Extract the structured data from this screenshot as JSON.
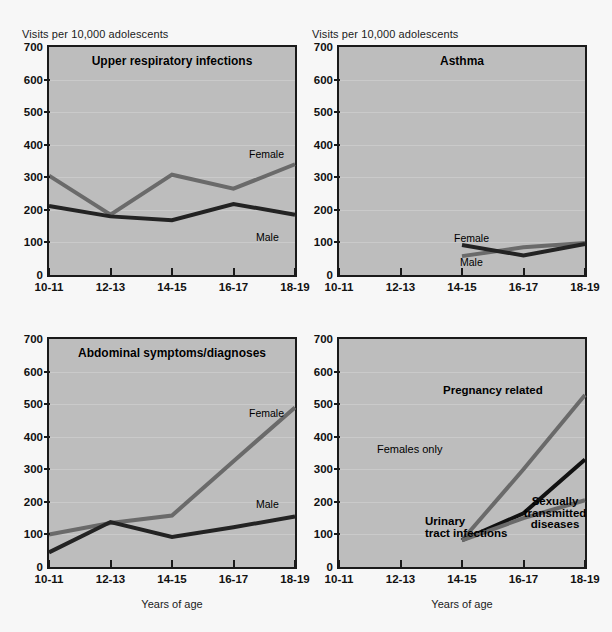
{
  "figure": {
    "y_axis_title": "Visits per 10,000 adolescents",
    "x_axis_caption": "Years of age",
    "colors": {
      "plot_background": "#bdbdbd",
      "page_background": "#f7f7f7",
      "axis": "#1a1a1a",
      "female_line": "#6a6a6a",
      "male_line": "#232323",
      "pregnancy_line": "#6a6a6a",
      "uti_line": "#111111",
      "std_line": "#6a6a6a",
      "gridline": "#cfcfcf"
    }
  },
  "axes": {
    "y_ticks": [
      "700",
      "600",
      "500",
      "400",
      "300",
      "200",
      "100",
      "0"
    ],
    "y_values": [
      700,
      600,
      500,
      400,
      300,
      200,
      100,
      0
    ],
    "x_ticks": [
      "10-11",
      "12-13",
      "14-15",
      "16-17",
      "18-19"
    ],
    "ylim": [
      0,
      700
    ]
  },
  "chart_data": [
    {
      "type": "line",
      "panel": "top-left",
      "title": "Upper respiratory infections",
      "xlabel": "",
      "ylabel": "Visits per 10,000 adolescents",
      "categories": [
        "10-11",
        "12-13",
        "14-15",
        "16-17",
        "18-19"
      ],
      "ylim": [
        0,
        700
      ],
      "grid": true,
      "legend": "inline-labels",
      "series": [
        {
          "name": "Female",
          "color": "#6a6a6a",
          "values": [
            305,
            185,
            308,
            265,
            340
          ],
          "label_position": "end-above"
        },
        {
          "name": "Male",
          "color": "#232323",
          "values": [
            212,
            180,
            168,
            218,
            185
          ],
          "label_position": "end-below"
        }
      ]
    },
    {
      "type": "line",
      "panel": "top-right",
      "title": "Asthma",
      "xlabel": "",
      "ylabel": "Visits per 10,000 adolescents",
      "categories": [
        "10-11",
        "12-13",
        "14-15",
        "16-17",
        "18-19"
      ],
      "ylim": [
        0,
        700
      ],
      "grid": true,
      "legend": "inline-labels",
      "series": [
        {
          "name": "Female",
          "color": "#6a6a6a",
          "values": [
            null,
            null,
            58,
            85,
            98
          ],
          "label_position": "mid-above"
        },
        {
          "name": "Male",
          "color": "#232323",
          "values": [
            null,
            null,
            92,
            60,
            95
          ],
          "label_position": "mid-below"
        }
      ]
    },
    {
      "type": "line",
      "panel": "bottom-left",
      "title": "Abdominal symptoms/diagnoses",
      "xlabel": "Years of age",
      "ylabel": "Visits per 10,000 adolescents",
      "categories": [
        "10-11",
        "12-13",
        "14-15",
        "16-17",
        "18-19"
      ],
      "ylim": [
        0,
        700
      ],
      "grid": true,
      "legend": "inline-labels",
      "series": [
        {
          "name": "Female",
          "color": "#6a6a6a",
          "values": [
            100,
            135,
            158,
            325,
            490
          ],
          "label_position": "end-above"
        },
        {
          "name": "Male",
          "color": "#232323",
          "values": [
            45,
            138,
            92,
            122,
            155
          ],
          "label_position": "end-above"
        }
      ]
    },
    {
      "type": "line",
      "panel": "bottom-right",
      "title": "",
      "annotation": "Females only",
      "xlabel": "Years of age",
      "ylabel": "Visits per 10,000 adolescents",
      "categories": [
        "10-11",
        "12-13",
        "14-15",
        "16-17",
        "18-19"
      ],
      "ylim": [
        0,
        700
      ],
      "grid": true,
      "legend": "inline-labels",
      "series": [
        {
          "name": "Pregnancy related",
          "color": "#6a6a6a",
          "values": [
            null,
            null,
            82,
            300,
            528
          ],
          "label_position": "above-right"
        },
        {
          "name": "Urinary tract infections",
          "color": "#111111",
          "values": [
            null,
            null,
            82,
            165,
            330
          ],
          "label_position": "below-mid"
        },
        {
          "name": "Sexually transmitted diseases",
          "color": "#6a6a6a",
          "values": [
            null,
            null,
            82,
            150,
            205
          ],
          "label_position": "below-right"
        }
      ]
    }
  ],
  "labels": {
    "female": "Female",
    "male": "Male",
    "females_only": "Females only",
    "pregnancy_related": "Pregnancy related",
    "urinary_tract_infections_l1": "Urinary",
    "urinary_tract_infections_l2": "tract infections",
    "std_l1": "Sexually",
    "std_l2": "transmitted",
    "std_l3": "diseases"
  },
  "titles": {
    "uri": "Upper respiratory infections",
    "asthma": "Asthma",
    "abdominal": "Abdominal symptoms/diagnoses"
  }
}
